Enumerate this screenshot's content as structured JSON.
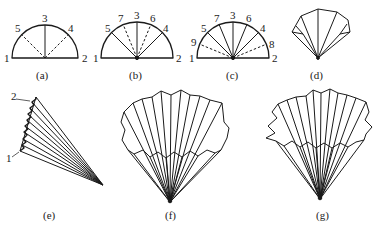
{
  "figure": {
    "stroke_color": "#1a1a1a",
    "background": "#ffffff",
    "panels": [
      {
        "id": "a",
        "caption": "(a)",
        "center": [
          45,
          58
        ],
        "radius": 33,
        "creases": [
          {
            "label": "5",
            "angle": 135,
            "style": "dashed"
          },
          {
            "label": "3",
            "angle": 90,
            "style": "solid"
          },
          {
            "label": "4",
            "angle": 45,
            "style": "dashed"
          }
        ],
        "end_labels": [
          "1",
          "2"
        ]
      },
      {
        "id": "b",
        "caption": "(b)",
        "center": [
          137,
          58
        ],
        "radius": 36,
        "creases": [
          {
            "label": "5",
            "angle": 135,
            "style": "solid"
          },
          {
            "label": "7",
            "angle": 112.5,
            "style": "dashed"
          },
          {
            "label": "3",
            "angle": 90,
            "style": "solid"
          },
          {
            "label": "6",
            "angle": 67.5,
            "style": "dashed"
          },
          {
            "label": "4",
            "angle": 45,
            "style": "solid"
          }
        ],
        "end_labels": [
          "1",
          "2"
        ]
      },
      {
        "id": "c",
        "caption": "(c)",
        "center": [
          233,
          58
        ],
        "radius": 36,
        "creases": [
          {
            "label": "9",
            "angle": 157.5,
            "style": "dashed"
          },
          {
            "label": "5",
            "angle": 135,
            "style": "solid"
          },
          {
            "label": "7",
            "angle": 112.5,
            "style": "solid"
          },
          {
            "label": "3",
            "angle": 90,
            "style": "solid"
          },
          {
            "label": "6",
            "angle": 67.5,
            "style": "solid"
          },
          {
            "label": "4",
            "angle": 45,
            "style": "solid"
          },
          {
            "label": "8",
            "angle": 22.5,
            "style": "dashed"
          }
        ],
        "end_labels": [
          "1",
          "2"
        ]
      },
      {
        "id": "d",
        "caption": "(d)"
      },
      {
        "id": "e",
        "caption": "(e)",
        "labels": [
          "2",
          "1"
        ]
      },
      {
        "id": "f",
        "caption": "(f)"
      },
      {
        "id": "g",
        "caption": "(g)"
      }
    ]
  }
}
